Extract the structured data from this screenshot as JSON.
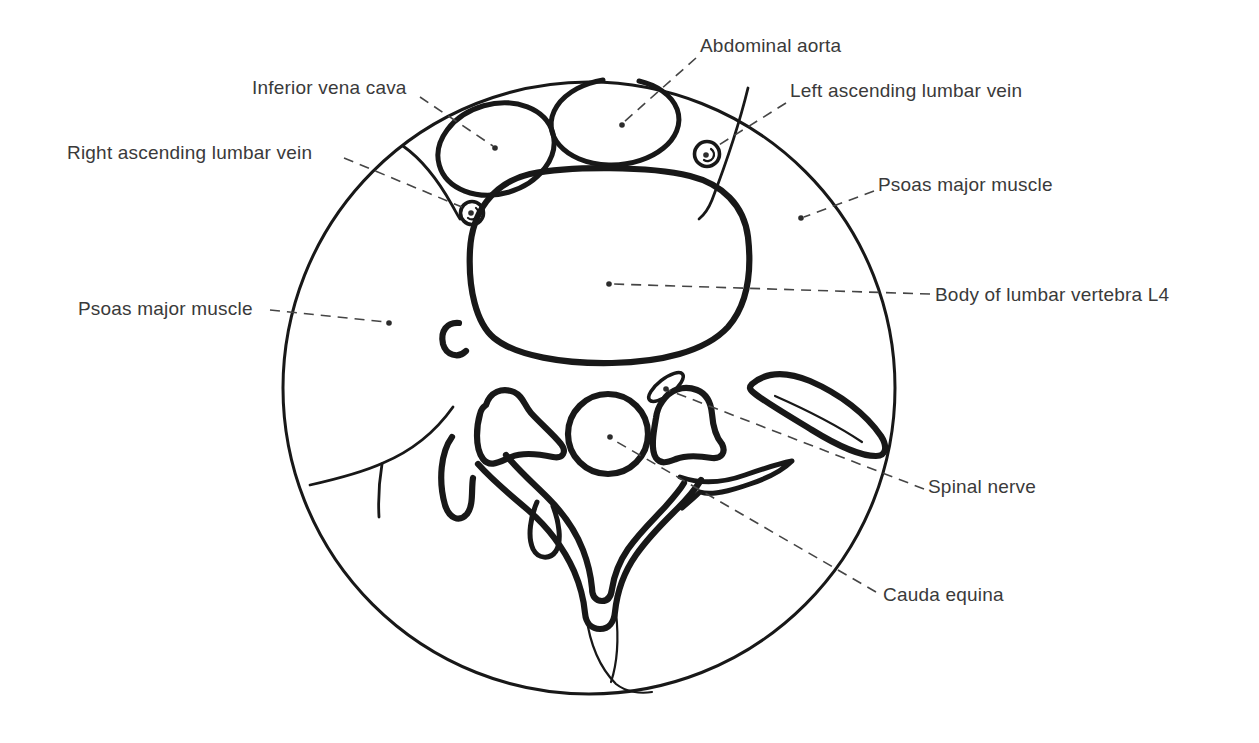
{
  "figure": {
    "colors": {
      "background": "#ffffff",
      "line": "#181818",
      "label_text": "#3a3a3a",
      "leader_line": "#454545"
    },
    "labels": [
      {
        "id": "abdominal-aorta",
        "text": "Abdominal aorta",
        "x": 700,
        "y": 36,
        "leader": [
          696,
          58,
          624,
          122
        ],
        "dot": [
          622,
          125
        ]
      },
      {
        "id": "inferior-vena-cava",
        "text": "Inferior vena cava",
        "x": 252,
        "y": 78,
        "leader": [
          420,
          97,
          493,
          146
        ],
        "dot": [
          495,
          148
        ]
      },
      {
        "id": "left-ascending-lumbar-vein",
        "text": "Left ascending lumbar vein",
        "x": 790,
        "y": 81,
        "leader": [
          786,
          103,
          714,
          148
        ],
        "dot": [
          706,
          155
        ]
      },
      {
        "id": "right-ascending-lumbar-vein",
        "text": "Right ascending lumbar vein",
        "x": 67,
        "y": 143,
        "leader": [
          344,
          158,
          462,
          207
        ],
        "dot": [
          471,
          213
        ]
      },
      {
        "id": "psoas-major-muscle-right",
        "text": "Psoas major muscle",
        "x": 878,
        "y": 175,
        "leader": [
          874,
          191,
          804,
          217
        ],
        "dot": [
          801,
          218
        ]
      },
      {
        "id": "body-of-lumbar-vertebra-l4",
        "text": "Body of lumbar vertebra L4",
        "x": 935,
        "y": 285,
        "leader": [
          930,
          294,
          612,
          284
        ],
        "dot": [
          609,
          284
        ]
      },
      {
        "id": "psoas-major-muscle-left",
        "text": "Psoas major muscle",
        "x": 78,
        "y": 299,
        "leader": [
          270,
          310,
          386,
          322
        ],
        "dot": [
          389,
          323
        ]
      },
      {
        "id": "spinal-nerve",
        "text": "Spinal nerve",
        "x": 928,
        "y": 477,
        "leader": [
          924,
          489,
          668,
          390
        ],
        "dot": [
          666,
          389
        ]
      },
      {
        "id": "cauda-equina",
        "text": "Cauda equina",
        "x": 883,
        "y": 585,
        "leader": [
          876,
          592,
          612,
          439
        ],
        "dot": [
          610,
          437
        ]
      }
    ]
  }
}
